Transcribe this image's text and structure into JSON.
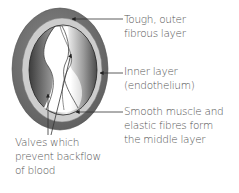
{
  "diagram": {
    "labels": {
      "outer_layer": {
        "line1": "Tough, outer",
        "line2": "fibrous layer"
      },
      "inner_layer": {
        "line1": "Inner layer",
        "line2": "(endothelium)"
      },
      "middle_layer": {
        "line1": "Smooth muscle and",
        "line2": "elastic fibres form",
        "line3": "the middle layer"
      },
      "valves": {
        "line1": "Valves which",
        "line2": "prevent backflow",
        "line3": "of blood"
      }
    },
    "colors": {
      "outer_layer": "#6e6e6e",
      "middle_ring": "#c9c9c9",
      "inner_layer_dark": "#4a4a4a",
      "inner_layer_light": "#e8e8e8",
      "lumen": "#ffffff",
      "text": "#555555",
      "leader_line": "#333333"
    }
  }
}
